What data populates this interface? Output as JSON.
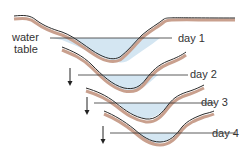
{
  "diagram": {
    "labels": {
      "water_table_line1": "water",
      "water_table_line2": "table",
      "day1": "day 1",
      "day2": "day 2",
      "day3": "day 3",
      "day4": "day 4"
    },
    "colors": {
      "ground_line": "#2a2a2a",
      "ground_shadow": "#c9a08e",
      "water_fill": "#d4e6f2",
      "water_line": "#333333",
      "text": "#333333"
    },
    "stages": [
      {
        "label": "day 1"
      },
      {
        "label": "day 2"
      },
      {
        "label": "day 3"
      },
      {
        "label": "day 4"
      }
    ],
    "arrows": [
      "down-arrow",
      "down-arrow",
      "down-arrow"
    ]
  }
}
